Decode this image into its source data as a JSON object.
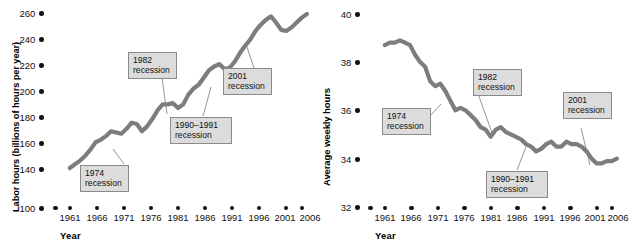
{
  "figure": {
    "panels": [
      {
        "id": "labor-hours",
        "ylabel": "Labor hours (billions of hours per year)",
        "xlabel": "Year",
        "yticks": [
          "260",
          "240",
          "220",
          "200",
          "180",
          "160",
          "140",
          "100"
        ],
        "xticks": [
          "1961",
          "1966",
          "1971",
          "1976",
          "1981",
          "1986",
          "1991",
          "1996",
          "2001",
          "2006"
        ],
        "callouts": [
          {
            "line1": "1974",
            "line2": "recession"
          },
          {
            "line1": "1982",
            "line2": "recession"
          },
          {
            "line1": "1990–1991",
            "line2": "recession"
          },
          {
            "line1": "2001",
            "line2": "recession"
          }
        ]
      },
      {
        "id": "average-weekly-hours",
        "ylabel": "Average weekly hours",
        "xlabel": "Year",
        "yticks": [
          "40",
          "38",
          "36",
          "34",
          "32"
        ],
        "xticks": [
          "1961",
          "1966",
          "1971",
          "1976",
          "1981",
          "1986",
          "1991",
          "1996",
          "2001",
          "2006"
        ],
        "callouts": [
          {
            "line1": "1974",
            "line2": "recession"
          },
          {
            "line1": "1982",
            "line2": "recession"
          },
          {
            "line1": "1990–1991",
            "line2": "recession"
          },
          {
            "line1": "2001",
            "line2": "recession"
          }
        ]
      }
    ]
  },
  "colors": {
    "series": "#7d7d7d",
    "callout_fill": "#dcdcdc",
    "callout_border": "#8a8a8a",
    "text": "#111111",
    "background": "#ffffff"
  },
  "chart_data": [
    {
      "type": "line",
      "title": "",
      "xlabel": "Year",
      "ylabel": "Labor hours (billions of hours per year)",
      "xlim": [
        1959,
        2008
      ],
      "ylim": [
        100,
        265
      ],
      "ytick_values": [
        260,
        240,
        220,
        200,
        180,
        160,
        140,
        100
      ],
      "xtick_values": [
        1961,
        1966,
        1971,
        1976,
        1981,
        1986,
        1991,
        1996,
        2001,
        2006
      ],
      "grid": false,
      "legend": "none",
      "annotations": [
        {
          "label": "1974 recession",
          "x": 1974
        },
        {
          "label": "1982 recession",
          "x": 1982
        },
        {
          "label": "1990–1991 recession",
          "x": 1990.5
        },
        {
          "label": "2001 recession",
          "x": 2001
        }
      ],
      "x": [
        1961,
        1962,
        1963,
        1964,
        1965,
        1966,
        1967,
        1968,
        1969,
        1970,
        1971,
        1972,
        1973,
        1974,
        1975,
        1976,
        1977,
        1978,
        1979,
        1980,
        1981,
        1982,
        1983,
        1984,
        1985,
        1986,
        1987,
        1988,
        1989,
        1990,
        1991,
        1992,
        1993,
        1994,
        1995,
        1996,
        1997,
        1998,
        1999,
        2000,
        2001,
        2002,
        2003,
        2004,
        2005,
        2006,
        2007
      ],
      "y": [
        131,
        134,
        137,
        141,
        146,
        152,
        154,
        157,
        161,
        160,
        159,
        163,
        168,
        167,
        161,
        165,
        171,
        178,
        183,
        183,
        184,
        180,
        183,
        191,
        196,
        199,
        205,
        211,
        214,
        216,
        212,
        213,
        218,
        225,
        231,
        236,
        243,
        248,
        252,
        255,
        250,
        244,
        243,
        246,
        250,
        254,
        257
      ]
    },
    {
      "type": "line",
      "title": "",
      "xlabel": "Year",
      "ylabel": "Average weekly hours",
      "xlim": [
        1959,
        2008
      ],
      "ylim": [
        32,
        40.5
      ],
      "ytick_values": [
        40,
        38,
        36,
        34,
        32
      ],
      "xtick_values": [
        1961,
        1966,
        1971,
        1976,
        1981,
        1986,
        1991,
        1996,
        2001,
        2006
      ],
      "grid": false,
      "legend": "none",
      "annotations": [
        {
          "label": "1974 recession",
          "x": 1974
        },
        {
          "label": "1982 recession",
          "x": 1982
        },
        {
          "label": "1990–1991 recession",
          "x": 1990.5
        },
        {
          "label": "2001 recession",
          "x": 2001
        }
      ],
      "x": [
        1961,
        1962,
        1963,
        1964,
        1965,
        1966,
        1967,
        1968,
        1969,
        1970,
        1971,
        1972,
        1973,
        1974,
        1975,
        1976,
        1977,
        1978,
        1979,
        1980,
        1981,
        1982,
        1983,
        1984,
        1985,
        1986,
        1987,
        1988,
        1989,
        1990,
        1991,
        1992,
        1993,
        1994,
        1995,
        1996,
        1997,
        1998,
        1999,
        2000,
        2001,
        2002,
        2003,
        2004,
        2005,
        2006,
        2007
      ],
      "y": [
        38.6,
        38.7,
        38.7,
        38.8,
        38.7,
        38.6,
        38.2,
        37.9,
        37.7,
        37.1,
        36.9,
        37.0,
        36.7,
        36.3,
        35.9,
        36.0,
        35.9,
        35.7,
        35.5,
        35.2,
        35.1,
        34.8,
        35.1,
        35.2,
        35.0,
        34.9,
        34.8,
        34.7,
        34.5,
        34.4,
        34.2,
        34.3,
        34.5,
        34.6,
        34.4,
        34.4,
        34.6,
        34.5,
        34.5,
        34.4,
        34.2,
        33.9,
        33.7,
        33.7,
        33.8,
        33.8,
        33.9
      ]
    }
  ]
}
